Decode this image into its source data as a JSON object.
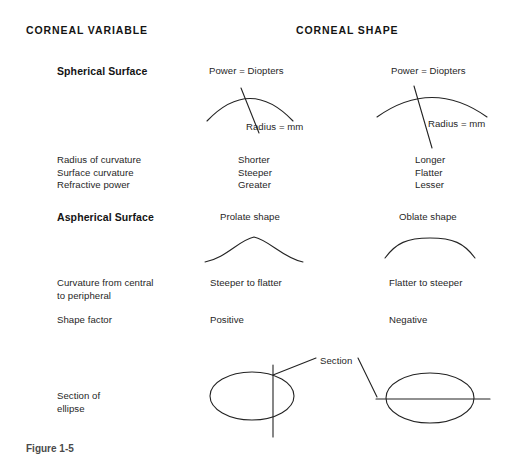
{
  "headers": {
    "variable": "CORNEAL VARIABLE",
    "shape": "CORNEAL SHAPE"
  },
  "sections": {
    "spherical": {
      "title": "Spherical Surface",
      "diagrams": {
        "left": {
          "power_label": "Power = Diopters",
          "radius_label": "Radius = mm"
        },
        "right": {
          "power_label": "Power = Diopters",
          "radius_label": "Radius = mm"
        }
      },
      "rows": [
        {
          "variable": "Radius of curvature",
          "left": "Shorter",
          "right": "Longer"
        },
        {
          "variable": "Surface curvature",
          "left": "Steeper",
          "right": "Flatter"
        },
        {
          "variable": "Refractive power",
          "left": "Greater",
          "right": "Lesser"
        }
      ],
      "variable_block": "Radius of curvature\nSurface curvature\nRefractive power",
      "left_block": "Shorter\nSteeper\nGreater",
      "right_block": "Longer\nFlatter\nLesser"
    },
    "aspherical": {
      "title": "Aspherical Surface",
      "diagrams": {
        "left": {
          "caption": "Prolate shape"
        },
        "right": {
          "caption": "Oblate shape"
        }
      },
      "rows": [
        {
          "variable": "Curvature from central\nto peripheral",
          "left": "Steeper to flatter",
          "right": "Flatter to steeper"
        },
        {
          "variable": "Shape factor",
          "left": "Positive",
          "right": "Negative"
        }
      ]
    },
    "ellipse": {
      "label": "Section of\nellipse",
      "section_callout": "Section"
    }
  },
  "figure_caption": "Figure 1-5",
  "colors": {
    "background": "#ffffff",
    "text": "#1a1a1a",
    "stroke": "#232323"
  }
}
